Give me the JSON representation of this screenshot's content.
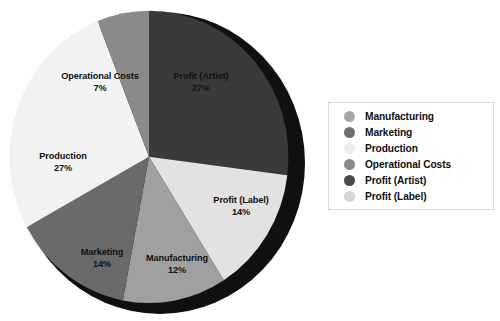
{
  "chart_data": {
    "type": "pie",
    "title": "",
    "labels": [
      "Profit (Artist)",
      "Profit (Label)",
      "Manufacturing",
      "Marketing",
      "Production",
      "Operational Costs"
    ],
    "values": [
      27,
      14,
      12,
      14,
      27,
      7
    ],
    "value_suffix": "%",
    "legend_position": "right",
    "grid": false,
    "style": "3d-pie",
    "slices": [
      {
        "label": "Profit (Artist)",
        "value": 27,
        "display": "27%",
        "color": "#3a3a3a",
        "start_deg": 0,
        "end_deg": 97.2
      },
      {
        "label": "Profit (Label)",
        "value": 14,
        "display": "14%",
        "color": "#e2e2e2",
        "start_deg": 97.2,
        "end_deg": 147.6
      },
      {
        "label": "Manufacturing",
        "value": 12,
        "display": "12%",
        "color": "#a0a0a0",
        "start_deg": 147.6,
        "end_deg": 190.8
      },
      {
        "label": "Marketing",
        "value": 14,
        "display": "14%",
        "color": "#6a6a6a",
        "start_deg": 190.8,
        "end_deg": 241.2
      },
      {
        "label": "Production",
        "value": 27,
        "display": "27%",
        "color": "#f2f2f2",
        "start_deg": 241.2,
        "end_deg": 338.4
      },
      {
        "label": "Operational Costs",
        "value": 7,
        "display": "7%",
        "color": "#8a8a8a",
        "start_deg": 338.4,
        "end_deg": 360
      }
    ],
    "depth_color": "#101010"
  },
  "labels": {
    "profit_artist": {
      "name": "Profit (Artist)",
      "value": "27%"
    },
    "profit_label": {
      "name": "Profit (Label)",
      "value": "14%"
    },
    "manufacturing": {
      "name": "Manufacturing",
      "value": "12%"
    },
    "marketing": {
      "name": "Marketing",
      "value": "14%"
    },
    "production": {
      "name": "Production",
      "value": "27%"
    },
    "operational": {
      "name": "Operational Costs",
      "value": "7%"
    }
  },
  "legend": {
    "items": [
      {
        "label": "Manufacturing",
        "color": "#a8a8a8"
      },
      {
        "label": "Marketing",
        "color": "#6e6e6e"
      },
      {
        "label": "Production",
        "color": "#ececec"
      },
      {
        "label": "Operational Costs",
        "color": "#8a8a8a"
      },
      {
        "label": "Profit (Artist)",
        "color": "#4a4a4a"
      },
      {
        "label": "Profit (Label)",
        "color": "#d4d4d4"
      }
    ]
  }
}
